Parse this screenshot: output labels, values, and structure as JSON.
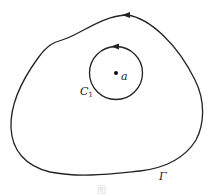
{
  "diagram": {
    "outer_contour": {
      "label": "Γ",
      "direction": "counterclockwise"
    },
    "inner_circle": {
      "label": "C",
      "label_subscript": "1",
      "direction": "counterclockwise"
    },
    "center_point": {
      "label": "a"
    },
    "caption": "图"
  },
  "colors": {
    "stroke": "#222222",
    "background": "#ffffff"
  }
}
